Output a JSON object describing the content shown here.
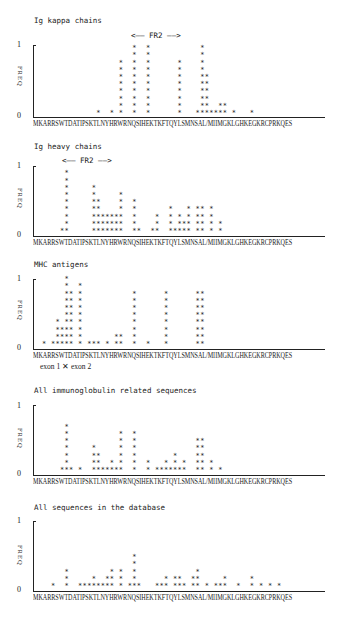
{
  "sequence": "MKARRSWTDATIPSKTLNYHRWRNQSIHEKTKFTQYLSMNSAL/MIIMGKLGHKEGKRCPRKQES",
  "ylabel": "FREQ",
  "ytick_top": "1",
  "ytick_bottom": "0",
  "fr2_label": "<—— FR2 ——>",
  "exon_label": "exon 1 ✕ exon 2",
  "panels": [
    {
      "title": "Ig kappa chains"
    },
    {
      "title": "Ig heavy chains"
    },
    {
      "title": "MHC antigens"
    },
    {
      "title": "All immunoglobulin related sequences"
    },
    {
      "title": "All sequences in the database"
    }
  ],
  "chart_data": [
    {
      "type": "bar",
      "title": "Ig kappa chains",
      "xlabel": "MKARRSWTDATIPSKTLNYHRWRNQSIHEKTKFTQYLSMNSAL/MIIMGKLGHKEGKRCPRKQES",
      "ylabel": "FREQ",
      "ylim": [
        0,
        1
      ],
      "annotation": "FR2 (columns ~21-37)",
      "star_columns": {
        "14": 1,
        "17": 1,
        "19": 8,
        "22": 10,
        "25": 10,
        "32": 8,
        "37": 10,
        "38": 6,
        "39": 1,
        "40": 1,
        "41": 2,
        "42": 2,
        "44": 1,
        "48": 1,
        "36": 1
      }
    },
    {
      "type": "bar",
      "title": "Ig heavy chains",
      "xlabel": "MKARRSWTDATIPSKTLNYHRWRNQSIHEKTKFTQYLSMNSAL/MIIMGKLGHKEGKRCPRKQES",
      "ylabel": "FREQ",
      "ylim": [
        0,
        1
      ],
      "annotation": "FR2 (columns ~7-19)",
      "star_columns": {
        "6": 1,
        "7": 9,
        "13": 7,
        "14": 5,
        "15": 3,
        "16": 3,
        "17": 3,
        "18": 3,
        "19": 6,
        "22": 5,
        "23": 1,
        "26": 1,
        "27": 3,
        "30": 4,
        "31": 1,
        "32": 3,
        "33": 2,
        "34": 4,
        "36": 4,
        "37": 4,
        "39": 4,
        "41": 2
      }
    },
    {
      "type": "bar",
      "title": "MHC antigens",
      "xlabel": "MKARRSWTDATIPSKTLNYHRWRNQSIHEKTKFTQYLSMNSAL/MIIMGKLGHKEGKRCPRKQES",
      "ylabel": "FREQ",
      "ylim": [
        0,
        1
      ],
      "annotation": "exon 1 / exon 2 boundary near column 7",
      "star_columns": {
        "2": 1,
        "4": 1,
        "5": 4,
        "6": 3,
        "7": 10,
        "8": 8,
        "10": 9,
        "12": 1,
        "13": 1,
        "14": 1,
        "16": 1,
        "18": 2,
        "19": 2,
        "22": 8,
        "25": 1,
        "29": 8,
        "36": 8,
        "37": 8
      }
    },
    {
      "type": "bar",
      "title": "All immunoglobulin related sequences",
      "xlabel": "MKARRSWTDATIPSKTLNYHRWRNQSIHEKTKFTQYLSMNSAL/MIIMGKLGHKEGKRCPRKQES",
      "ylabel": "FREQ",
      "ylim": [
        0,
        1
      ],
      "star_columns": {
        "6": 1,
        "7": 7,
        "8": 1,
        "10": 1,
        "13": 4,
        "14": 3,
        "15": 1,
        "16": 1,
        "17": 2,
        "18": 1,
        "19": 6,
        "22": 6,
        "25": 2,
        "27": 1,
        "28": 1,
        "29": 2,
        "30": 1,
        "31": 3,
        "32": 1,
        "33": 2,
        "36": 5,
        "37": 5,
        "39": 2,
        "41": 1
      }
    },
    {
      "type": "bar",
      "title": "All sequences in the database",
      "xlabel": "MKARRSWTDATIPSKTLNYHRWRNQSIHEKTKFTQYLSMNSAL/MIIMGKLGHKEGKRCPRKQES",
      "ylabel": "FREQ",
      "ylim": [
        0,
        1
      ],
      "star_columns": {
        "4": 1,
        "7": 3,
        "10": 1,
        "11": 1,
        "12": 1,
        "13": 2,
        "14": 1,
        "15": 1,
        "16": 2,
        "17": 3,
        "19": 3,
        "21": 1,
        "22": 5,
        "23": 1,
        "27": 1,
        "28": 1,
        "29": 2,
        "31": 2,
        "32": 2,
        "33": 1,
        "35": 2,
        "36": 3,
        "38": 1,
        "40": 1,
        "41": 1,
        "42": 2,
        "45": 1,
        "48": 2,
        "50": 1,
        "52": 1,
        "54": 1
      }
    }
  ]
}
